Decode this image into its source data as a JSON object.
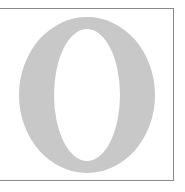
{
  "panel": {
    "width": 185,
    "height": 192,
    "background_color": "#ffffff",
    "rule_color": "#8a8a8a",
    "caption": ""
  },
  "glyph": {
    "character": "O",
    "name": "capital-letter-o",
    "style": "serif",
    "fill_color": "#c8c8c8",
    "counter_color": "#ffffff",
    "left": 17,
    "top": 18,
    "width": 136,
    "height": 156,
    "thick_stroke_px": 35,
    "thin_stroke_px": 12
  },
  "rules": {
    "top_label": "top-rule",
    "bottom_label": "bottom-rule",
    "right_label": "right-rule"
  }
}
